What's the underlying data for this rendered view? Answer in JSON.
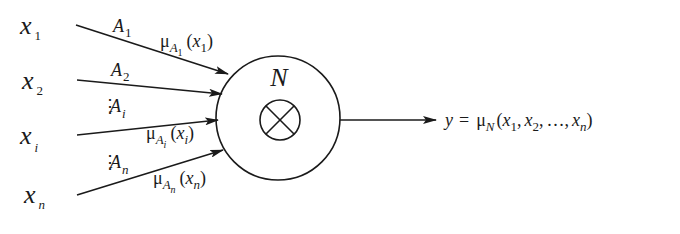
{
  "diagram": {
    "inputs": [
      {
        "var": "x",
        "sub": "1",
        "fuzzy_set": "A",
        "set_sub": "1",
        "membership": "μ",
        "mem_set": "A",
        "mem_set_sub": "1",
        "mem_arg_var": "x",
        "mem_arg_sub": "1"
      },
      {
        "var": "x",
        "sub": "2",
        "fuzzy_set": "A",
        "set_sub": "2"
      },
      {
        "var": "x",
        "sub": "i",
        "fuzzy_set": "A",
        "set_sub": "i",
        "membership": "μ",
        "mem_set": "A",
        "mem_set_sub": "i",
        "mem_arg_var": "x",
        "mem_arg_sub": "i"
      },
      {
        "var": "x",
        "sub": "n",
        "fuzzy_set": "A",
        "set_sub": "n",
        "membership": "μ",
        "mem_set": "A",
        "mem_set_sub": "n",
        "mem_arg_var": "x",
        "mem_arg_sub": "n"
      }
    ],
    "ellipsis": "⋮",
    "node": {
      "label": "N",
      "operator": "⊗",
      "operator_name": "product"
    },
    "output": {
      "lhs": "y",
      "equals": "=",
      "mu": "μ",
      "mu_sub": "N",
      "open": "(",
      "args": [
        {
          "var": "x",
          "sub": "1"
        },
        {
          "var": "x",
          "sub": "2"
        },
        {
          "var": "x",
          "sub": "n"
        }
      ],
      "sep": ",",
      "dots": "…",
      "close": ")"
    },
    "colors": {
      "ink": "#1a1a1a",
      "background": "#ffffff"
    }
  }
}
